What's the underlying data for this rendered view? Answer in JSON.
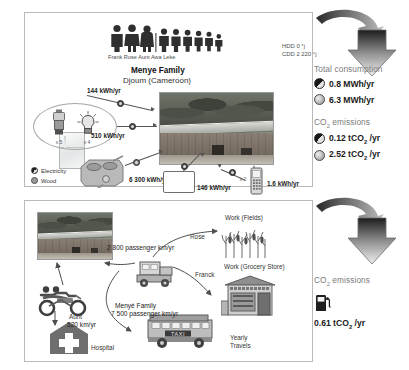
{
  "energy_panel": {
    "family_name": "Menye Family",
    "family_place": "Djoum (Cameroon)",
    "people_names": "Frank Rose Aunt Awa Leke",
    "climate": {
      "hdd": "HDD 0 °j",
      "cdd": "CDD 2 220 °j"
    },
    "legend": [
      {
        "icon": "electricity-icon",
        "label": "Electricity"
      },
      {
        "icon": "wood-icon",
        "label": "Wood"
      }
    ],
    "appliances": [
      {
        "name": "refrigerator",
        "value": "144 kWh/yr",
        "count": ""
      },
      {
        "name": "lamps",
        "value": "510 kWh/yr",
        "count_lantern": "x 5",
        "count_bulb": "x 4"
      },
      {
        "name": "wood-stove",
        "value": "6 300 kWh/yr",
        "count": ""
      },
      {
        "name": "television",
        "value": "146 kWh/yr",
        "count": ""
      },
      {
        "name": "mobile-phone",
        "value": "1.6 kWh/yr",
        "count": "x 2"
      }
    ]
  },
  "energy_results": {
    "title": "Total consumption",
    "rows": [
      {
        "icon": "electricity-icon",
        "value": "0.8 MWh/yr"
      },
      {
        "icon": "wood-icon",
        "value": "6.3 MWh/yr"
      }
    ],
    "emissions_title": "CO2 emissions",
    "emissions_rows": [
      {
        "icon": "electricity-icon",
        "value": "0.12 tCO2 /yr"
      },
      {
        "icon": "wood-icon",
        "value": "2.52 tCO2 /yr"
      }
    ]
  },
  "mobility_panel": {
    "destinations": [
      {
        "name": "work-fields",
        "label": "Work (Fields)"
      },
      {
        "name": "work-grocery-store",
        "label": "Work (Grocery Store)"
      },
      {
        "name": "hospital",
        "label": "Hospital"
      },
      {
        "name": "yearly-travels",
        "label": "Yearly\nTravels"
      }
    ],
    "travellers": [
      {
        "name": "rose",
        "label": "Rose"
      },
      {
        "name": "franck",
        "label": "Franck"
      },
      {
        "name": "aunt",
        "label": "Aunt"
      }
    ],
    "flows": [
      {
        "name": "car-flow",
        "value": "2 800 passenger km/yr"
      },
      {
        "name": "family-flow",
        "label": "Menyé Family",
        "value": "7 500 passenger km/yr"
      },
      {
        "name": "aunt-flow",
        "value": "520 km/yr"
      }
    ]
  },
  "mobility_results": {
    "emissions_title": "CO2 emissions",
    "icon": "fuel-pump-icon",
    "value": "0.61 tCO2 /yr"
  }
}
